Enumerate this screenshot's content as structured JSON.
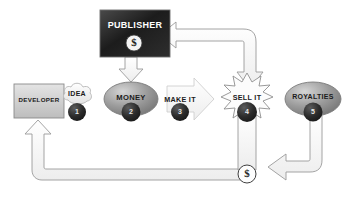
{
  "diagram": {
    "nodes": {
      "publisher": {
        "label": "PUBLISHER",
        "badge": "$",
        "shape": "rectangle",
        "fill": "#1d1d1d"
      },
      "developer": {
        "label": "DEVELOPER",
        "shape": "rectangle",
        "fill": "#cfcfcf"
      },
      "idea": {
        "label": "IDEA",
        "step": "1",
        "shape": "cloud",
        "fill": "#f2f2f2"
      },
      "money": {
        "label": "MONEY",
        "step": "2",
        "shape": "ellipse",
        "fill": "#9b9b9b"
      },
      "make_it": {
        "label": "MAKE IT",
        "step": "3",
        "shape": "arrow-right",
        "fill": "#ededed"
      },
      "sell_it": {
        "label": "SELL IT",
        "step": "4",
        "shape": "starburst",
        "fill": "#fbfbfb"
      },
      "royalties": {
        "label": "ROYALTIES",
        "step": "5",
        "shape": "ellipse",
        "fill": "#9b9b9b"
      },
      "cash": {
        "label": "$",
        "shape": "circle",
        "fill": "#ffffff"
      }
    },
    "connectors": [
      {
        "name": "publisher-to-money",
        "from": "publisher",
        "to": "money",
        "style": "block-arrow-down"
      },
      {
        "name": "makeit-to-sellit",
        "from": "make_it",
        "to": "sell_it",
        "style": "block-arrow-right"
      },
      {
        "name": "sellit-to-publisher",
        "from": "sell_it",
        "to": "publisher",
        "style": "bent-block-arrow-left"
      },
      {
        "name": "sellit-to-cash",
        "from": "sell_it",
        "to": "cash",
        "style": "band-down"
      },
      {
        "name": "royalties-to-cash",
        "from": "royalties",
        "to": "cash",
        "style": "bent-block-arrow-left"
      },
      {
        "name": "cash-to-developer",
        "from": "cash",
        "to": "developer",
        "style": "bent-block-arrow-up"
      }
    ],
    "colors": {
      "outline": "#8d8d8d",
      "arrow_fill": "#fbfbfb",
      "dark_circle": "#2a2a2a",
      "text_dark": "#1b1b1b",
      "text_light": "#ffffff"
    }
  }
}
